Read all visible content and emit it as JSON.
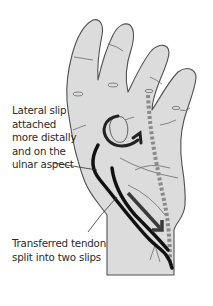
{
  "figure": {
    "colors": {
      "skin_fill": "#dcdcdc",
      "outline": "#505050",
      "tendon": "#111111",
      "dashed_tendon": "#8a8a8a",
      "arrow": "#3a3a3a",
      "background": "#ffffff"
    }
  },
  "labels": {
    "lateral_slip": {
      "lines": [
        "Lateral slip",
        "attached",
        "more distally",
        "and on the",
        "ulnar aspect"
      ],
      "text": "Lateral slip\nattached\nmore distally\nand on the\nulnar aspect"
    },
    "transferred_tendon": {
      "lines": [
        "Transferred tendon",
        "split into two slips"
      ],
      "text": "Transferred tendon\nsplit into two slips"
    }
  },
  "annotations": [
    {
      "name": "rotation-arrow",
      "semantic": "curved arrow indicating rotation around finger"
    },
    {
      "name": "pull-direction-arrow",
      "semantic": "straight arrow pointing proximally along tendon"
    },
    {
      "name": "dashed-tendon",
      "semantic": "dashed line showing original tendon path"
    }
  ]
}
